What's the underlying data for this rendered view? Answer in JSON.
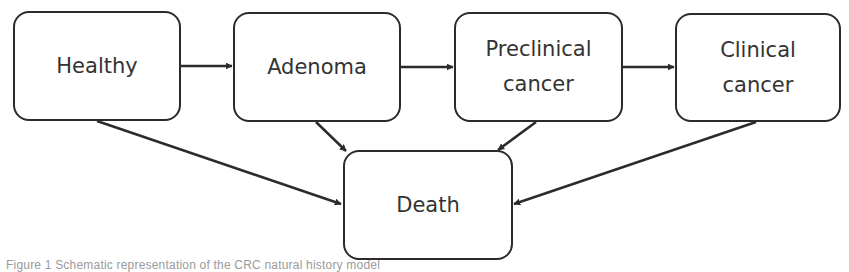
{
  "diagram": {
    "type": "state-transition",
    "nodes": [
      {
        "id": "healthy",
        "lines": [
          "Healthy"
        ]
      },
      {
        "id": "adenoma",
        "lines": [
          "Adenoma"
        ]
      },
      {
        "id": "preclinical",
        "lines": [
          "Preclinical",
          "cancer"
        ]
      },
      {
        "id": "clinical",
        "lines": [
          "Clinical",
          "cancer"
        ]
      },
      {
        "id": "death",
        "lines": [
          "Death"
        ]
      }
    ],
    "edges": [
      {
        "from": "healthy",
        "to": "adenoma"
      },
      {
        "from": "adenoma",
        "to": "preclinical"
      },
      {
        "from": "preclinical",
        "to": "clinical"
      },
      {
        "from": "healthy",
        "to": "death"
      },
      {
        "from": "adenoma",
        "to": "death"
      },
      {
        "from": "preclinical",
        "to": "death"
      },
      {
        "from": "clinical",
        "to": "death"
      }
    ],
    "colors": {
      "stroke": "#2b2b2b",
      "text": "#333333",
      "background": "#ffffff"
    }
  },
  "caption": {
    "text": "Figure 1 Schematic representation of the CRC natural history model"
  }
}
